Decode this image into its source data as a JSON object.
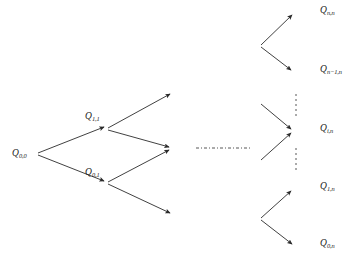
{
  "figure": {
    "type": "lattice-tree-diagram",
    "background_color": "#ffffff",
    "stroke_color": "#2b2b2b",
    "label_color": "#1a1a1a",
    "width": 362,
    "height": 266
  },
  "nodes": [
    {
      "id": "q00",
      "base": "Q",
      "subscript": "0,0",
      "x": 12,
      "y": 148,
      "label_x": 12,
      "label_y": 149
    },
    {
      "id": "q11",
      "base": "Q",
      "subscript": "1,1",
      "x": 108,
      "y": 128,
      "label_x": 85,
      "label_y": 112
    },
    {
      "id": "q01",
      "base": "Q",
      "subscript": "0,1",
      "x": 108,
      "y": 182,
      "label_x": 85,
      "label_y": 168
    },
    {
      "id": "qnn",
      "base": "Q",
      "subscript": "n,n",
      "x": 295,
      "y": 13,
      "label_x": 320,
      "label_y": 6
    },
    {
      "id": "qn1n",
      "base": "Q",
      "subscript": "n−1,n",
      "x": 295,
      "y": 72,
      "label_x": 320,
      "label_y": 65
    },
    {
      "id": "qin",
      "base": "Q",
      "subscript": "i,n",
      "x": 295,
      "y": 131,
      "label_x": 320,
      "label_y": 124
    },
    {
      "id": "q1n",
      "base": "Q",
      "subscript": "1,n",
      "x": 295,
      "y": 189,
      "label_x": 320,
      "label_y": 182
    },
    {
      "id": "q0n",
      "base": "Q",
      "subscript": "0,n",
      "x": 295,
      "y": 246,
      "label_x": 320,
      "label_y": 239
    }
  ],
  "edges": [
    {
      "id": "e1",
      "from": [
        38,
        153
      ],
      "to": [
        104,
        127
      ],
      "arrow": true
    },
    {
      "id": "e2",
      "from": [
        38,
        155
      ],
      "to": [
        104,
        181
      ],
      "arrow": true
    },
    {
      "id": "e3",
      "from": [
        108,
        128
      ],
      "to": [
        170,
        94
      ],
      "arrow": true
    },
    {
      "id": "e4",
      "from": [
        108,
        130
      ],
      "to": [
        169,
        147
      ],
      "arrow": true
    },
    {
      "id": "e5",
      "from": [
        108,
        182
      ],
      "to": [
        169,
        150
      ],
      "arrow": true
    },
    {
      "id": "e6",
      "from": [
        108,
        184
      ],
      "to": [
        170,
        213
      ],
      "arrow": true
    },
    {
      "id": "e7",
      "from": [
        261,
        45
      ],
      "to": [
        292,
        15
      ],
      "arrow": true
    },
    {
      "id": "e8",
      "from": [
        261,
        47
      ],
      "to": [
        291,
        70
      ],
      "arrow": true
    },
    {
      "id": "e9",
      "from": [
        261,
        104
      ],
      "to": [
        291,
        129
      ],
      "arrow": true
    },
    {
      "id": "e10",
      "from": [
        261,
        160
      ],
      "to": [
        291,
        133
      ],
      "arrow": true
    },
    {
      "id": "e11",
      "from": [
        261,
        218
      ],
      "to": [
        291,
        191
      ],
      "arrow": true
    },
    {
      "id": "e12",
      "from": [
        261,
        220
      ],
      "to": [
        292,
        244
      ],
      "arrow": true
    }
  ],
  "dash_connectors": [
    {
      "id": "center-dashdot",
      "orientation": "horizontal",
      "from": [
        196,
        148
      ],
      "to": [
        252,
        148
      ]
    },
    {
      "id": "upper-vertical-dash",
      "orientation": "vertical",
      "from": [
        296,
        94
      ],
      "to": [
        296,
        118
      ]
    },
    {
      "id": "lower-vertical-dash",
      "orientation": "vertical",
      "from": [
        296,
        148
      ],
      "to": [
        296,
        172
      ]
    }
  ]
}
